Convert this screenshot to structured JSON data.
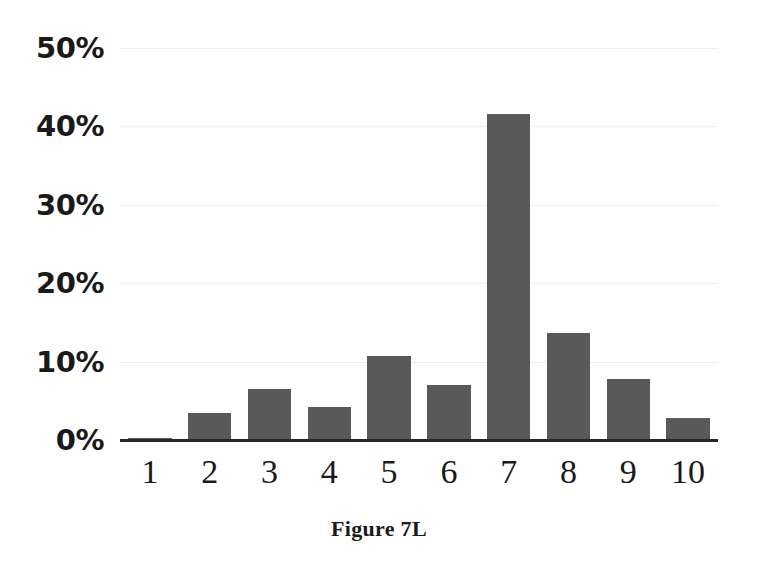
{
  "figure": {
    "caption": "Figure 7L"
  },
  "colors": {
    "bar_fill": "#595959",
    "axis_line": "#262626",
    "gridline": "#f0f0f0",
    "text": "#1a1a1a",
    "background": "#ffffff"
  },
  "chart_data": {
    "type": "bar",
    "title": "Figure 7L",
    "xlabel": "",
    "ylabel": "",
    "categories": [
      "1",
      "2",
      "3",
      "4",
      "5",
      "6",
      "7",
      "8",
      "9",
      "10"
    ],
    "values": [
      0.3,
      3.5,
      6.5,
      4.2,
      10.7,
      7.0,
      41.6,
      13.7,
      7.8,
      2.8
    ],
    "ylim": [
      0,
      50
    ],
    "yticks": [
      0,
      10,
      20,
      30,
      40,
      50
    ],
    "ytick_labels": [
      "0%",
      "10%",
      "20%",
      "30%",
      "40%",
      "50%"
    ],
    "value_format": "percent",
    "grid": true,
    "grid_axis": "y",
    "legend": false,
    "legend_position": "none",
    "bar_color": "#595959",
    "orientation": "vertical"
  }
}
